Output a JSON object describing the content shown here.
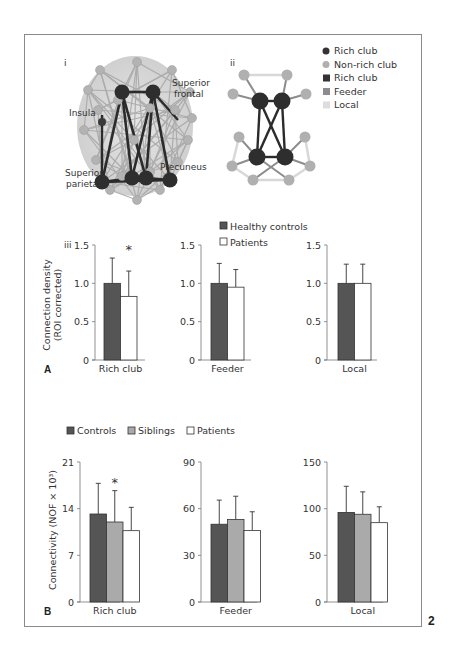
{
  "figure_number": "2",
  "panel_A": {
    "label": "A",
    "subpanel_i": {
      "label": "i",
      "region_labels": [
        "Superior frontal",
        "Insula",
        "Superior parietal",
        "Precuneus"
      ]
    },
    "subpanel_ii": {
      "label": "ii",
      "legend": [
        {
          "marker": "circle",
          "color": "#333333",
          "label": "Rich club"
        },
        {
          "marker": "circle",
          "color": "#b0b0b0",
          "label": "Non-rich club"
        },
        {
          "marker": "square",
          "color": "#333333",
          "label": "Rich club"
        },
        {
          "marker": "square",
          "color": "#8c8c8c",
          "label": "Feeder"
        },
        {
          "marker": "square",
          "color": "#dddddd",
          "label": "Local"
        }
      ]
    },
    "subpanel_iii": {
      "label": "iii",
      "ylabel_line1": "Connection density",
      "ylabel_line2": "(ROI corrected)",
      "legend": [
        {
          "label": "Healthy controls",
          "color": "#555555"
        },
        {
          "label": "Patients",
          "color": "#ffffff"
        }
      ]
    }
  },
  "panel_B": {
    "label": "B",
    "ylabel": "Connectivity (NOF × 10³)",
    "legend": [
      {
        "label": "Controls",
        "color": "#555555"
      },
      {
        "label": "Siblings",
        "color": "#aaaaaa"
      },
      {
        "label": "Patients",
        "color": "#ffffff"
      }
    ]
  },
  "chart_data": [
    {
      "type": "bar",
      "panel": "A-iii",
      "title": "Rich club",
      "categories": [
        "Rich club"
      ],
      "xlabel": "Rich club",
      "ylabel": "Connection density (ROI corrected)",
      "ylim": [
        0,
        1.5
      ],
      "yticks": [
        "0",
        "0.5",
        "1.0",
        "1.5"
      ],
      "series": [
        {
          "name": "Healthy controls",
          "values": [
            1.0
          ],
          "error": [
            0.33
          ]
        },
        {
          "name": "Patients",
          "values": [
            0.83
          ],
          "error": [
            0.33
          ]
        }
      ],
      "annotation": "*"
    },
    {
      "type": "bar",
      "panel": "A-iii",
      "title": "Feeder",
      "categories": [
        "Feeder"
      ],
      "xlabel": "Feeder",
      "ylim": [
        0,
        1.5
      ],
      "yticks": [
        "0",
        "0.5",
        "1.0",
        "1.5"
      ],
      "series": [
        {
          "name": "Healthy controls",
          "values": [
            1.0
          ],
          "error": [
            0.26
          ]
        },
        {
          "name": "Patients",
          "values": [
            0.95
          ],
          "error": [
            0.23
          ]
        }
      ]
    },
    {
      "type": "bar",
      "panel": "A-iii",
      "title": "Local",
      "categories": [
        "Local"
      ],
      "xlabel": "Local",
      "ylim": [
        0,
        1.5
      ],
      "yticks": [
        "0",
        "0.5",
        "1.0",
        "1.5"
      ],
      "series": [
        {
          "name": "Healthy controls",
          "values": [
            1.0
          ],
          "error": [
            0.25
          ]
        },
        {
          "name": "Patients",
          "values": [
            1.0
          ],
          "error": [
            0.25
          ]
        }
      ]
    },
    {
      "type": "bar",
      "panel": "B",
      "title": "Rich club",
      "categories": [
        "Rich club"
      ],
      "xlabel": "Rich club",
      "ylabel": "Connectivity (NOF × 10³)",
      "ylim": [
        0,
        21
      ],
      "yticks": [
        "0",
        "7",
        "14",
        "21"
      ],
      "series": [
        {
          "name": "Controls",
          "values": [
            13.2
          ],
          "error": [
            4.6
          ]
        },
        {
          "name": "Siblings",
          "values": [
            12.0
          ],
          "error": [
            4.7
          ]
        },
        {
          "name": "Patients",
          "values": [
            10.7
          ],
          "error": [
            3.5
          ]
        }
      ],
      "annotation": "*"
    },
    {
      "type": "bar",
      "panel": "B",
      "title": "Feeder",
      "categories": [
        "Feeder"
      ],
      "xlabel": "Feeder",
      "ylim": [
        0,
        90
      ],
      "yticks": [
        "0",
        "30",
        "60",
        "90"
      ],
      "series": [
        {
          "name": "Controls",
          "values": [
            50
          ],
          "error": [
            15.5
          ]
        },
        {
          "name": "Siblings",
          "values": [
            53
          ],
          "error": [
            15
          ]
        },
        {
          "name": "Patients",
          "values": [
            46
          ],
          "error": [
            12
          ]
        }
      ]
    },
    {
      "type": "bar",
      "panel": "B",
      "title": "Local",
      "categories": [
        "Local"
      ],
      "xlabel": "Local",
      "ylim": [
        0,
        150
      ],
      "yticks": [
        "0",
        "50",
        "100",
        "150"
      ],
      "series": [
        {
          "name": "Controls",
          "values": [
            96
          ],
          "error": [
            28
          ]
        },
        {
          "name": "Siblings",
          "values": [
            94
          ],
          "error": [
            24
          ]
        },
        {
          "name": "Patients",
          "values": [
            85
          ],
          "error": [
            17
          ]
        }
      ]
    }
  ]
}
